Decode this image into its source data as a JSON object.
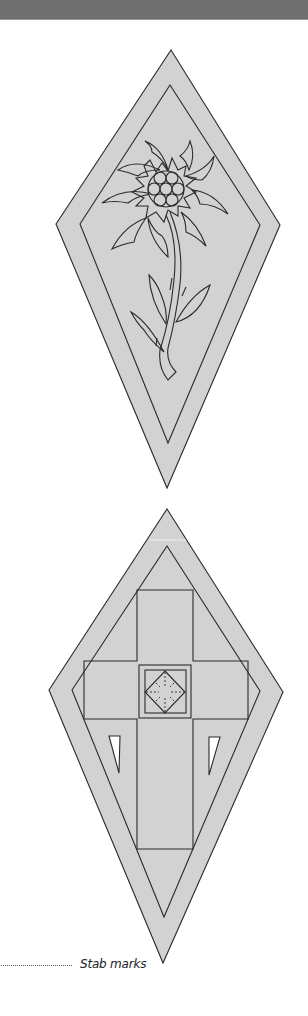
{
  "page": {
    "header_band_color": "#6f6f6f",
    "background": "#ffffff"
  },
  "colors": {
    "fill": "#d2d2d2",
    "stroke": "#2a2a2a",
    "cutout": "#ffffff"
  },
  "patterns": [
    {
      "name": "edelweiss-diamond",
      "motif": "Edelweiss flower with stem and leaves inside a double-bordered diamond"
    },
    {
      "name": "cross-diamond",
      "motif": "Cross with centered square and diamond inside a double-bordered diamond, two triangular cut-outs"
    }
  ],
  "legend": {
    "label": "Stab marks",
    "line_style": "dotted"
  }
}
